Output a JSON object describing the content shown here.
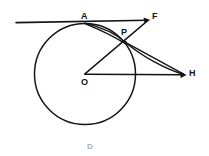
{
  "figure": {
    "background_color": "#ffffff",
    "ink_color": "#141414",
    "width": 209,
    "height": 156,
    "labels": {
      "A": "A",
      "F": "F",
      "P": "P",
      "O": "O",
      "H": "H",
      "D": "D"
    },
    "points": {
      "A": {
        "x": 85,
        "y": 23,
        "name": "tangent-point-a"
      },
      "F": {
        "x": 150,
        "y": 21,
        "name": "ray-end-f"
      },
      "P": {
        "x": 125,
        "y": 42,
        "name": "intersection-point-p"
      },
      "O": {
        "x": 85,
        "y": 74,
        "name": "circle-center-o"
      },
      "H": {
        "x": 186,
        "y": 75,
        "name": "ray-end-h"
      },
      "tangent_left_end": {
        "x": 16,
        "y": 22,
        "name": "tangent-left-end"
      }
    },
    "circle": {
      "center_x": 85,
      "center_y": 74,
      "radius": 50
    },
    "segments": [
      {
        "name": "tangent-line-at-a",
        "from": "tangent_left_end",
        "to": "F",
        "arrow": true
      },
      {
        "name": "segment-o-to-f-through-p",
        "from": "O",
        "to": "F",
        "arrow": true
      },
      {
        "name": "arc-a-to-h-through-p",
        "from": "A",
        "to": "H",
        "arrow": true
      },
      {
        "name": "segment-o-to-h",
        "from": "O",
        "to": "H",
        "arrow": true
      }
    ]
  }
}
